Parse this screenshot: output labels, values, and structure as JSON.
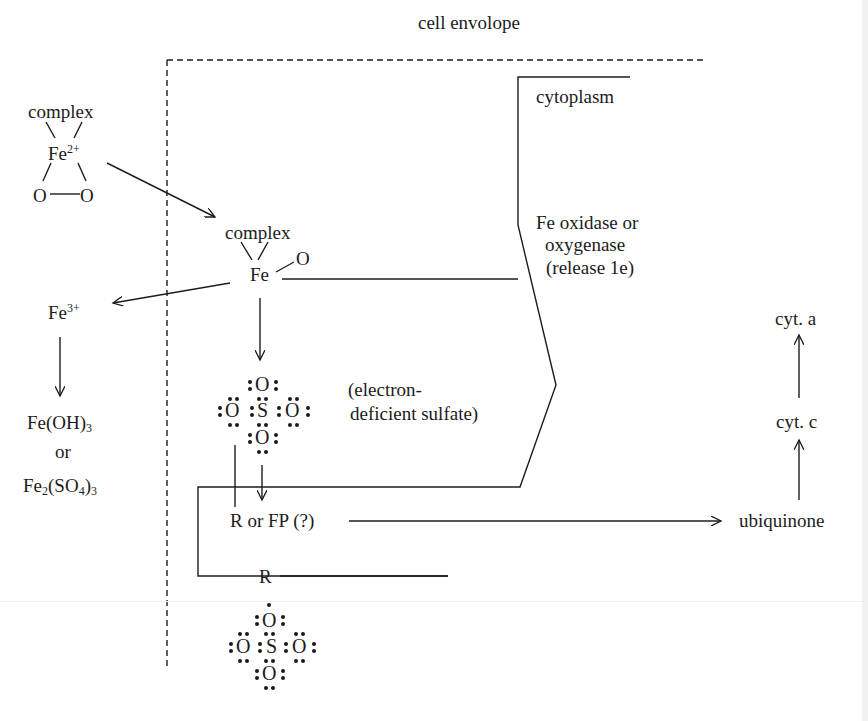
{
  "diagram": {
    "regions": {
      "cell_envelope": "cell envolope",
      "cytoplasm": "cytoplasm"
    },
    "nodes": {
      "complex_top_label": "complex",
      "fe2_base": "Fe",
      "fe2_charge": "2+",
      "o_left": "O",
      "o_right": "O",
      "complex_mid_label": "complex",
      "fe_mid": "Fe",
      "o_mid": "O",
      "fe3_base": "Fe",
      "fe3_charge": "3+",
      "feoh3_base": "Fe(OH)",
      "feoh3_sub": "3",
      "or_word": "or",
      "fe2so43_a": "Fe",
      "fe2so43_sub1": "2",
      "fe2so43_b": "(SO",
      "fe2so43_sub2": "4",
      "fe2so43_c": ")",
      "fe2so43_sub3": "3",
      "enzyme_line1": "Fe oxidase or",
      "enzyme_line2": "oxygenase",
      "enzyme_line3": "(release 1e)",
      "sulfate_note_line1": "(electron-",
      "sulfate_note_line2": "deficient sulfate)",
      "r_or_fp": "R or FP (?)",
      "r_bottom": "R",
      "ubiquinone": "ubiquinone",
      "cyt_c": "cyt. c",
      "cyt_a": "cyt. a"
    },
    "sulfate_top": {
      "top": "O",
      "left": "O",
      "center": "S",
      "right": "O",
      "bottom": "O"
    },
    "sulfate_bottom": {
      "top": "O",
      "left": "O",
      "center": "S",
      "right": "O",
      "bottom": "O"
    },
    "colors": {
      "ink": "#1c1c1c",
      "background": "#ffffff"
    }
  }
}
